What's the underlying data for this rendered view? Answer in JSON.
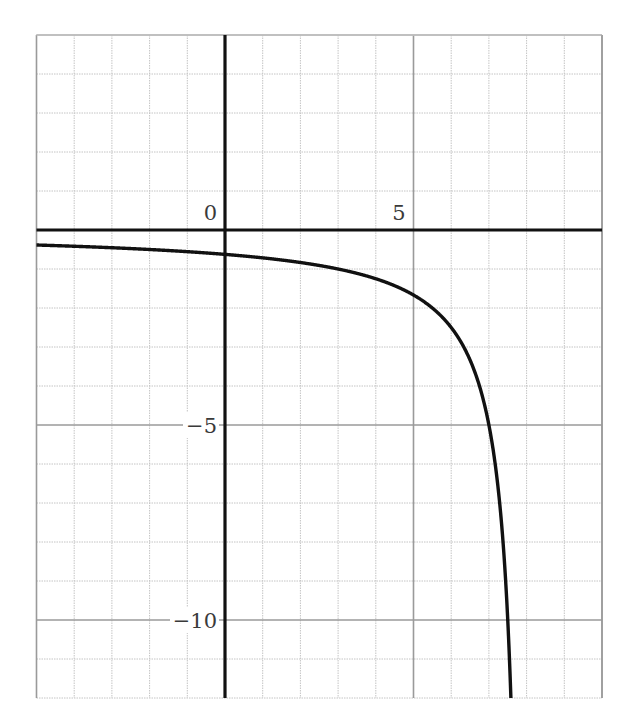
{
  "chart_data": {
    "type": "line",
    "title": "",
    "xlabel": "",
    "ylabel": "",
    "xlim": [
      -5,
      10
    ],
    "ylim": [
      -12,
      5
    ],
    "grid": true,
    "grid_minor_step": 1,
    "grid_major_step": 5,
    "x_tick_labels": [
      {
        "value": 0,
        "label": "0"
      },
      {
        "value": 5,
        "label": "5"
      }
    ],
    "y_tick_labels": [
      {
        "value": -5,
        "label": "−5"
      },
      {
        "value": -10,
        "label": "−10"
      }
    ],
    "series": [
      {
        "name": "y = -5/(8 - x)",
        "expression": "-5/(8-x)",
        "color": "#111111",
        "x": [
          -5,
          -4,
          -3,
          -2,
          -1,
          0,
          1,
          2,
          3,
          4,
          5,
          6,
          6.5,
          7,
          7.25,
          7.5,
          7.58
        ],
        "y": [
          -0.385,
          -0.417,
          -0.455,
          -0.5,
          -0.556,
          -0.625,
          -0.714,
          -0.833,
          -1.0,
          -1.25,
          -1.667,
          -2.5,
          -3.333,
          -5.0,
          -6.667,
          -10.0,
          -11.9
        ]
      }
    ],
    "legend": null
  },
  "colors": {
    "axis": "#111111",
    "major_grid": "#9a9a9a",
    "minor_grid": "#c4c4c4",
    "curve": "#111111",
    "label": "#3a3a3a",
    "background": "#ffffff"
  }
}
